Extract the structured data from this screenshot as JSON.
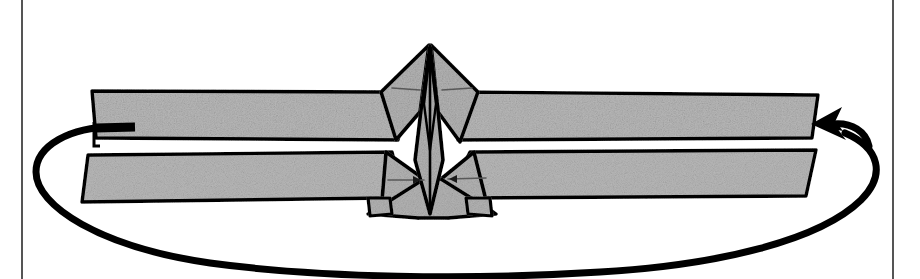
{
  "page": {
    "background_color": "#ffffff",
    "width": 920,
    "height": 279
  },
  "margins": {
    "rule_color": "#555555",
    "left_rule_x": 22,
    "right_rule_x": 893,
    "rule_width": 2
  },
  "palette": {
    "paper_white": "#ffffff",
    "strip_fill": "#b4b4b4",
    "strip_fill_light": "#c2c2c2",
    "ink_black": "#000000",
    "crease_gray": "#6a6a6a"
  },
  "illustration": {
    "name": "two-band-fold-with-encircling-cord",
    "description": "Line drawing of two horizontal gray fabric bands with pointed diamond folds meeting at the centre, crossed by a vertical spine, and encircled by a heavy black cord that loops out to the left and right.",
    "elements": [
      {
        "id": "upper-band",
        "label": "upper gray band",
        "kind": "strip"
      },
      {
        "id": "lower-band",
        "label": "lower gray band",
        "kind": "strip"
      },
      {
        "id": "upper-diamond",
        "label": "upper diamond fold",
        "kind": "fold"
      },
      {
        "id": "lower-star",
        "label": "lower star fold",
        "kind": "fold"
      },
      {
        "id": "center-spine",
        "label": "central vertical spine",
        "kind": "fold"
      },
      {
        "id": "cord-loop",
        "label": "encircling black cord",
        "kind": "cord"
      },
      {
        "id": "cord-tail-left",
        "label": "left cord tail",
        "kind": "cord"
      },
      {
        "id": "cord-arrow-right",
        "label": "right cord arrowhead",
        "kind": "arrow"
      }
    ],
    "crease_marks": [
      {
        "id": "crease-upper-left",
        "x1": 392,
        "y1": 88,
        "x2": 420,
        "y2": 90
      },
      {
        "id": "crease-upper-right",
        "x1": 442,
        "y1": 90,
        "x2": 472,
        "y2": 88
      },
      {
        "id": "crease-lower-left",
        "x1": 388,
        "y1": 180,
        "x2": 424,
        "y2": 180
      },
      {
        "id": "crease-lower-right",
        "x1": 448,
        "y1": 179,
        "x2": 486,
        "y2": 178
      }
    ]
  },
  "chart_data": {
    "type": "table",
    "categories": [],
    "values": []
  }
}
